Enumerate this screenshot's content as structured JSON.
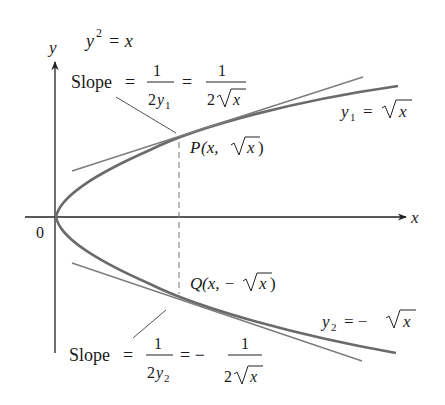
{
  "figure": {
    "equation": {
      "lhs_base": "y",
      "lhs_exp": "2",
      "rhs": "= x"
    },
    "axes": {
      "x_label": "x",
      "y_label": "y",
      "origin_label": "0"
    },
    "upper": {
      "slope_word": "Slope",
      "eq1": "=",
      "frac1_num": "1",
      "frac1_den_coef": "2",
      "frac1_den_var": "y",
      "frac1_den_sub": "1",
      "eq2": "=",
      "frac2_num": "1",
      "frac2_den_coef": "2",
      "frac2_den_rad": "x",
      "curve_label_var": "y",
      "curve_label_sub": "1",
      "curve_label_eq": "=",
      "curve_label_rad": "x",
      "point_label_prefix": "P",
      "point_label_open": "(x, ",
      "point_label_rad": "x",
      "point_label_close": ")"
    },
    "lower": {
      "slope_word": "Slope",
      "eq1": "=",
      "frac1_num": "1",
      "frac1_den_coef": "2",
      "frac1_den_var": "y",
      "frac1_den_sub": "2",
      "eq2": "= −",
      "frac2_num": "1",
      "frac2_den_coef": "2",
      "frac2_den_rad": "x",
      "curve_label_var": "y",
      "curve_label_sub": "2",
      "curve_label_eq": "= −",
      "curve_label_rad": "x",
      "point_label_prefix": "Q",
      "point_label_open": "(x, −",
      "point_label_rad": "x",
      "point_label_close": ")"
    },
    "colors": {
      "curve": "#6b6b6b",
      "tangent": "#7c7c7c",
      "axis": "#222222",
      "text": "#1a1a1a"
    }
  }
}
